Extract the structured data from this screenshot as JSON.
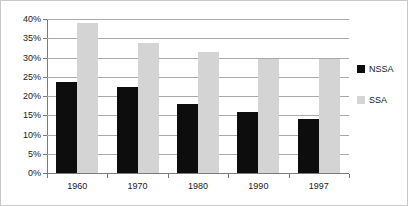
{
  "chart_data": {
    "type": "bar",
    "title": "",
    "subtitle": "",
    "xlabel": "",
    "ylabel": "",
    "categories": [
      "1960",
      "1970",
      "1980",
      "1990",
      "1997"
    ],
    "series": [
      {
        "name": "NSSA",
        "color": "#0d0d0d",
        "values": [
          23.7,
          22.4,
          18.0,
          15.8,
          14.0
        ]
      },
      {
        "name": "SSA",
        "color": "#d4d4d4",
        "values": [
          39.0,
          33.8,
          31.4,
          29.5,
          29.5
        ]
      }
    ],
    "ylim": [
      0,
      40
    ],
    "ytick_step": 5,
    "ytick_labels": [
      "0%",
      "5%",
      "10%",
      "15%",
      "20%",
      "25%",
      "30%",
      "35%",
      "40%"
    ],
    "ytick_values": [
      0,
      5,
      10,
      15,
      20,
      25,
      30,
      35,
      40
    ],
    "grid": true,
    "grid_axis": "y",
    "legend_position": "right",
    "value_suffix": "%"
  },
  "legend": {
    "entries": [
      {
        "label": "NSSA",
        "swatch": "nssa"
      },
      {
        "label": "SSA",
        "swatch": "ssa"
      }
    ]
  }
}
